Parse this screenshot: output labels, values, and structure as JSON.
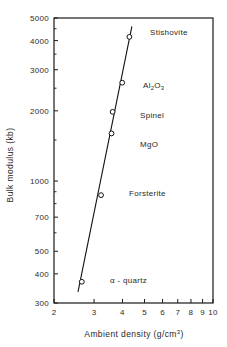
{
  "chart_data": {
    "type": "scatter",
    "title": "",
    "xlabel": "Ambient density (g/cm3)",
    "ylabel": "Bulk modulus (kb)",
    "xlabel_parts": {
      "text": "Ambient  density  (g/cm",
      "sup": "3",
      "tail": ")"
    },
    "xscale": "log",
    "yscale": "log",
    "xlim": [
      2,
      10
    ],
    "ylim": [
      300,
      5000
    ],
    "grid": false,
    "legend": null,
    "x_tick_labels": [
      "2",
      "3",
      "4",
      "5",
      "6",
      "7",
      "8",
      "9",
      "10"
    ],
    "x_tick_values": [
      2,
      3,
      4,
      5,
      6,
      7,
      8,
      9,
      10
    ],
    "y_tick_labels": [
      "300",
      "400",
      "500",
      "700",
      "1000",
      "2000",
      "3000",
      "4000",
      "5000"
    ],
    "y_tick_values": [
      300,
      400,
      500,
      700,
      1000,
      2000,
      3000,
      4000,
      5000
    ],
    "y_minor_ticks": [
      600,
      800,
      900,
      1500,
      2500,
      3500,
      4500
    ],
    "points": [
      {
        "label": "α - quartz",
        "x": 2.65,
        "y": 370
      },
      {
        "label": "Forsterite",
        "x": 3.22,
        "y": 870
      },
      {
        "label": "MgO",
        "x": 3.58,
        "y": 1600
      },
      {
        "label": "Spinel",
        "x": 3.62,
        "y": 1980
      },
      {
        "label": "Al2O3",
        "x": 3.99,
        "y": 2640
      },
      {
        "label": "Stishovite",
        "x": 4.29,
        "y": 4150
      }
    ],
    "annotations": [
      {
        "name": "stishovite",
        "text": "Stishovite"
      },
      {
        "name": "alumina",
        "text": "Al2O3",
        "base1": "Al",
        "sub1": "2",
        "base2": "O",
        "sub2": "3"
      },
      {
        "name": "spinel",
        "text": "Spinel"
      },
      {
        "name": "mgo",
        "text": "MgO"
      },
      {
        "name": "forsterite",
        "text": "Forsterite"
      },
      {
        "name": "alpha-quartz",
        "text": "α - quartz"
      }
    ],
    "trendline": {
      "description": "straight line on log-log axes through all six points",
      "x_start": 2.55,
      "y_start": 335,
      "x_end": 4.4,
      "y_end": 4600
    },
    "colors": {
      "axis": "#1a1a1a",
      "line": "#111111",
      "marker_fill": "#ffffff",
      "background": "#ffffff"
    }
  }
}
